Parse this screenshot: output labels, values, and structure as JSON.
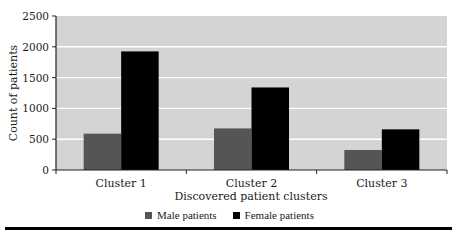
{
  "chart_data": {
    "type": "bar",
    "title": "",
    "xlabel": "Discovered patient clusters",
    "ylabel": "Count of patients",
    "categories": [
      "Cluster 1",
      "Cluster 2",
      "Cluster 3"
    ],
    "series": [
      {
        "name": "Male patients",
        "color": "#555555",
        "values": [
          590,
          675,
          325
        ]
      },
      {
        "name": "Female patients",
        "color": "#000000",
        "values": [
          1925,
          1340,
          660
        ]
      }
    ],
    "ylim": [
      0,
      2500
    ],
    "yticks": [
      0,
      500,
      1000,
      1500,
      2000,
      2500
    ],
    "grid": true,
    "legend_position": "bottom",
    "plot_background": "#d4d4d4",
    "gridline_color": "#ffffff"
  },
  "axis": {
    "xlabel": "Discovered patient clusters",
    "ylabel": "Count of patients"
  },
  "legend": {
    "items": [
      {
        "label": "Male patients",
        "color": "#555555"
      },
      {
        "label": "Female patients",
        "color": "#000000"
      }
    ]
  }
}
